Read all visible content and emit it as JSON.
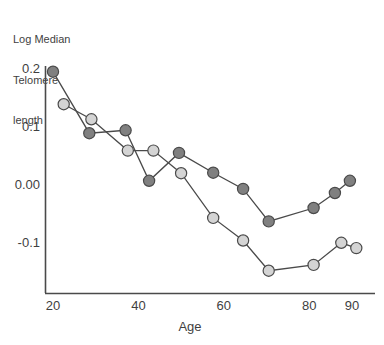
{
  "chart": {
    "type": "line",
    "y_axis_title_lines": [
      "Log Median",
      "Telomere",
      "length"
    ],
    "xlabel": "Age",
    "ylabel": "Log Median Telomere length",
    "title": "",
    "xticks": [
      "20",
      "40",
      "60",
      "80",
      "90"
    ],
    "yticks": [
      "0.2",
      "0.1",
      "0.00",
      "-0.1"
    ],
    "colors": {
      "series_dark": "#808080",
      "series_light": "#d4d4d4",
      "marker_stroke": "#4a4a4a",
      "line": "#4a4a4a",
      "axis": "#4a4a4a",
      "text": "#3f3f3f"
    }
  },
  "chart_data": {
    "type": "line",
    "title": "",
    "xlabel": "Age",
    "ylabel": "Log Median Telomere length",
    "xlim": [
      18,
      92
    ],
    "ylim": [
      -0.19,
      0.215
    ],
    "grid": false,
    "legend": "none",
    "xticks": [
      20,
      40,
      60,
      80,
      90
    ],
    "xtick_labels": [
      "20",
      "40",
      "60",
      "80",
      "90"
    ],
    "yticks": [
      0.2,
      0.1,
      0.0,
      -0.1
    ],
    "ytick_labels": [
      "0.2",
      "0.1",
      "0.00",
      "-0.1"
    ],
    "series": [
      {
        "name": "dark",
        "marker": "circle-filled-gray",
        "color": "#808080",
        "points": [
          {
            "x": 20,
            "y": 0.197
          },
          {
            "x": 28.5,
            "y": 0.091
          },
          {
            "x": 37,
            "y": 0.096
          },
          {
            "x": 42.5,
            "y": 0.009
          },
          {
            "x": 49.5,
            "y": 0.057
          },
          {
            "x": 57.5,
            "y": 0.023
          },
          {
            "x": 64.5,
            "y": -0.005
          },
          {
            "x": 70.5,
            "y": -0.061
          },
          {
            "x": 81,
            "y": -0.038
          },
          {
            "x": 86,
            "y": -0.012
          },
          {
            "x": 89.5,
            "y": 0.009
          }
        ]
      },
      {
        "name": "light",
        "marker": "circle-filled-lightgray",
        "color": "#d4d4d4",
        "points": [
          {
            "x": 22.5,
            "y": 0.141
          },
          {
            "x": 29,
            "y": 0.115
          },
          {
            "x": 37.5,
            "y": 0.061
          },
          {
            "x": 43.5,
            "y": 0.061
          },
          {
            "x": 50,
            "y": 0.022
          },
          {
            "x": 57.5,
            "y": -0.055
          },
          {
            "x": 64.5,
            "y": -0.094
          },
          {
            "x": 70.5,
            "y": -0.146
          },
          {
            "x": 81,
            "y": -0.136
          },
          {
            "x": 87.5,
            "y": -0.098
          },
          {
            "x": 91,
            "y": -0.107
          }
        ]
      }
    ]
  }
}
